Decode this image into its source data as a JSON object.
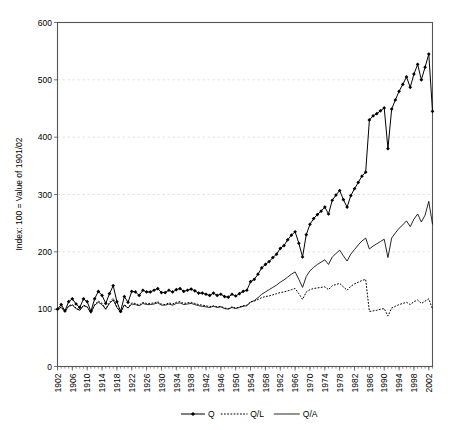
{
  "chart_data": {
    "type": "line",
    "title": "",
    "xlabel": "",
    "ylabel": "Index: 100 = Value of 1901/02",
    "ylim": [
      0,
      600
    ],
    "ytick_step": 100,
    "yticks": [
      0,
      100,
      200,
      300,
      400,
      500,
      600
    ],
    "xlim": [
      1902,
      2003
    ],
    "xtick_step": 4,
    "xticks": [
      1902,
      1906,
      1910,
      1914,
      1918,
      1922,
      1926,
      1930,
      1934,
      1938,
      1942,
      1946,
      1950,
      1954,
      1958,
      1962,
      1966,
      1970,
      1974,
      1978,
      1982,
      1986,
      1990,
      1994,
      1998,
      2002
    ],
    "grid": "horizontal-dashed",
    "legend_position": "bottom-center",
    "legend": [
      {
        "name": "Q",
        "style": "solid-line-with-diamond-markers"
      },
      {
        "name": "Q/L",
        "style": "dotted-line"
      },
      {
        "name": "Q/A",
        "style": "solid-thin-line"
      }
    ],
    "x": [
      1902,
      1903,
      1904,
      1905,
      1906,
      1907,
      1908,
      1909,
      1910,
      1911,
      1912,
      1913,
      1914,
      1915,
      1916,
      1917,
      1918,
      1919,
      1920,
      1921,
      1922,
      1923,
      1924,
      1925,
      1926,
      1927,
      1928,
      1929,
      1930,
      1931,
      1932,
      1933,
      1934,
      1935,
      1936,
      1937,
      1938,
      1939,
      1940,
      1941,
      1942,
      1943,
      1944,
      1945,
      1946,
      1947,
      1948,
      1949,
      1950,
      1951,
      1952,
      1953,
      1954,
      1955,
      1956,
      1957,
      1958,
      1959,
      1960,
      1961,
      1962,
      1963,
      1964,
      1965,
      1966,
      1967,
      1968,
      1969,
      1970,
      1971,
      1972,
      1973,
      1974,
      1975,
      1976,
      1977,
      1978,
      1979,
      1980,
      1981,
      1982,
      1983,
      1984,
      1985,
      1986,
      1987,
      1988,
      1989,
      1990,
      1991,
      1992,
      1993,
      1994,
      1995,
      1996,
      1997,
      1998,
      1999,
      2000,
      2001,
      2002,
      2003
    ],
    "series": [
      {
        "name": "Q",
        "values": [
          100,
          108,
          97,
          113,
          118,
          109,
          103,
          118,
          113,
          96,
          118,
          131,
          124,
          110,
          127,
          141,
          113,
          96,
          122,
          112,
          131,
          130,
          124,
          133,
          130,
          130,
          133,
          136,
          129,
          129,
          133,
          130,
          134,
          136,
          131,
          133,
          135,
          132,
          128,
          128,
          126,
          124,
          128,
          124,
          126,
          122,
          121,
          126,
          123,
          127,
          131,
          133,
          148,
          152,
          161,
          172,
          178,
          183,
          190,
          196,
          206,
          211,
          221,
          229,
          235,
          215,
          191,
          230,
          248,
          258,
          265,
          271,
          278,
          266,
          290,
          299,
          307,
          291,
          278,
          298,
          310,
          321,
          332,
          339,
          430,
          437,
          441,
          446,
          451,
          380,
          449,
          465,
          480,
          492,
          505,
          487,
          510,
          527,
          500,
          522,
          545,
          445
        ]
      },
      {
        "name": "Q/L",
        "values": [
          100,
          104,
          95,
          106,
          108,
          102,
          98,
          107,
          104,
          93,
          108,
          114,
          110,
          100,
          112,
          119,
          104,
          93,
          108,
          102,
          111,
          110,
          107,
          112,
          110,
          110,
          111,
          113,
          109,
          108,
          111,
          109,
          112,
          113,
          110,
          111,
          112,
          110,
          108,
          107,
          106,
          104,
          106,
          104,
          105,
          102,
          101,
          104,
          102,
          104,
          106,
          107,
          113,
          114,
          117,
          120,
          122,
          123,
          125,
          127,
          129,
          130,
          132,
          134,
          136,
          127,
          117,
          130,
          134,
          136,
          137,
          138,
          139,
          134,
          141,
          143,
          145,
          139,
          133,
          140,
          144,
          147,
          150,
          152,
          96,
          97,
          98,
          100,
          101,
          88,
          102,
          105,
          108,
          110,
          112,
          108,
          113,
          116,
          110,
          114,
          118,
          100
        ]
      },
      {
        "name": "Q/A",
        "values": [
          100,
          103,
          96,
          105,
          107,
          101,
          98,
          106,
          104,
          94,
          107,
          112,
          108,
          100,
          110,
          116,
          103,
          95,
          107,
          102,
          109,
          108,
          106,
          110,
          108,
          108,
          109,
          111,
          107,
          107,
          109,
          107,
          110,
          111,
          108,
          109,
          110,
          108,
          106,
          105,
          104,
          103,
          105,
          103,
          104,
          101,
          100,
          103,
          101,
          103,
          105,
          106,
          112,
          115,
          120,
          126,
          130,
          134,
          138,
          142,
          147,
          151,
          156,
          161,
          165,
          152,
          138,
          157,
          167,
          173,
          178,
          182,
          186,
          178,
          191,
          197,
          203,
          193,
          184,
          196,
          204,
          212,
          219,
          224,
          205,
          210,
          214,
          218,
          222,
          190,
          224,
          233,
          241,
          247,
          254,
          244,
          257,
          266,
          252,
          264,
          288,
          248
        ]
      }
    ]
  }
}
